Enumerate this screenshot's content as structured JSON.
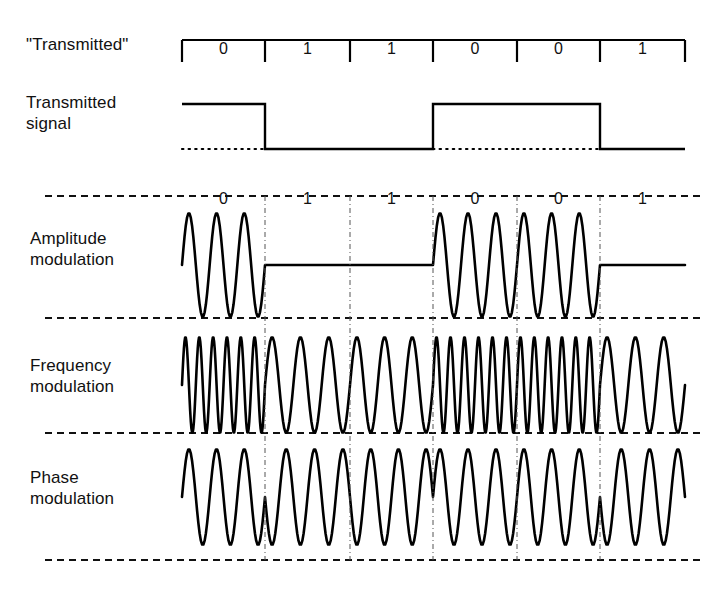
{
  "figure": {
    "background": "#ffffff",
    "ink": "#000000"
  },
  "labels": {
    "transmitted_quoted": "\"Transmitted\"",
    "transmitted_signal_line1": "Transmitted",
    "transmitted_signal_line2": "signal",
    "amplitude_line1": "Amplitude",
    "amplitude_line2": "modulation",
    "frequency_line1": "Frequency",
    "frequency_line2": "modulation",
    "phase_line1": "Phase",
    "phase_line2": "modulation"
  },
  "chart_data": {
    "type": "line",
    "bits": [
      "0",
      "1",
      "1",
      "0",
      "0",
      "1"
    ],
    "bit_boundaries_px": [
      182,
      265,
      350,
      433,
      517,
      600,
      685
    ],
    "plot_left_px": 182,
    "plot_right_px": 685,
    "series": [
      {
        "name": "Transmitted signal",
        "encoding": "high = bit 0, low = bit 1",
        "levels": [
          1,
          0,
          0,
          1,
          1,
          0
        ],
        "high_y_px": 104,
        "low_y_px": 149
      },
      {
        "name": "Amplitude modulation",
        "encoding": "carrier present (3 cycles per cell) = bit 0, flat = bit 1",
        "cycles_per_bit": [
          3,
          0,
          0,
          3,
          3,
          0
        ],
        "center_y_px": 265,
        "amplitude_px": 52
      },
      {
        "name": "Frequency modulation",
        "encoding": "high frequency (6 cycles) = bit 0, low frequency (3 cycles) = bit 1",
        "cycles_per_bit": [
          6,
          3,
          3,
          6,
          6,
          3
        ],
        "center_y_px": 385,
        "amplitude_px": 48
      },
      {
        "name": "Phase modulation",
        "encoding": "constant 3 cycles per cell, phase inverted on bit 1",
        "cycles_per_bit": [
          3,
          3,
          3,
          3,
          3,
          3
        ],
        "phase_per_bit_deg": [
          0,
          180,
          180,
          0,
          0,
          180
        ],
        "center_y_px": 497,
        "amplitude_px": 48
      }
    ],
    "separators_y_px": [
      196,
      318,
      433,
      560
    ],
    "separator_style": "dashed",
    "separator_x_range_px": [
      45,
      705
    ],
    "grid": false,
    "legend": "none",
    "xlabel": "",
    "ylabel": ""
  }
}
